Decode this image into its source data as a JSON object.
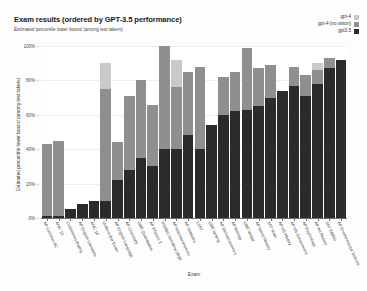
{
  "header": {
    "title": "Exam results (ordered by GPT-3.5 performance)",
    "subtitle": "Estimated percentile lower bound (among test takers)"
  },
  "legend": {
    "items": [
      {
        "label": "gpt-4",
        "color": "#c9c9c9"
      },
      {
        "label": "gpt-4 (no vision)",
        "color": "#8f8f8f"
      },
      {
        "label": "gpt3.5",
        "color": "#2b2b2b"
      }
    ]
  },
  "axes": {
    "x_title": "Exam",
    "y_title": "Estimated percentile lower bound (among test takers)",
    "y_ticks": [
      "100%",
      "80%",
      "60%",
      "40%",
      "20%",
      "0%"
    ],
    "tick_dash": "–"
  },
  "chart_data": {
    "type": "bar",
    "title": "Exam results (ordered by GPT-3.5 performance)",
    "subtitle": "Estimated percentile lower bound (among test takers)",
    "xlabel": "Exam",
    "ylabel": "Estimated percentile lower bound (among test takers)",
    "ylim": [
      0,
      100
    ],
    "ytick_values": [
      0,
      20,
      40,
      60,
      80,
      100
    ],
    "grid": true,
    "legend_position": "top-right",
    "stacked": true,
    "categories": [
      "AP Calculus BC",
      "AMC 12",
      "Codeforces Rating",
      "AP English Literature",
      "AMC 10",
      "Uniform Bar Exam",
      "AP English Language",
      "AP Chemistry",
      "GRE Quantitative",
      "AP Physics 2",
      "USABO Semifinal 2020",
      "AP Macroeconomics",
      "AP Statistics",
      "LSAT",
      "GRE Writing",
      "AP Microeconomics",
      "AP Biology",
      "GRE Verbal",
      "AP World History",
      "SAT Math",
      "AP US History",
      "AP US Government",
      "AP Psychology",
      "AP Art History",
      "SAT EBRW",
      "AP Environmental Science"
    ],
    "series": [
      {
        "name": "gpt3.5",
        "color": "#2b2b2b",
        "values": [
          1,
          1,
          5,
          8,
          10,
          10,
          22,
          28,
          35,
          30,
          40,
          40,
          48,
          40,
          54,
          60,
          62,
          63,
          65,
          70,
          74,
          77,
          71,
          78,
          87,
          92
        ]
      },
      {
        "name": "gpt-4 (no vision)",
        "color": "#8f8f8f",
        "values": [
          43,
          45,
          5,
          8,
          10,
          75,
          44,
          71,
          80,
          66,
          100,
          76,
          85,
          88,
          54,
          82,
          85,
          99,
          87,
          89,
          74,
          88,
          83,
          86,
          93,
          92
        ]
      },
      {
        "name": "gpt-4",
        "color": "#c9c9c9",
        "values": [
          43,
          45,
          5,
          8,
          10,
          90,
          44,
          71,
          80,
          66,
          100,
          92,
          85,
          88,
          54,
          82,
          85,
          99,
          87,
          89,
          74,
          88,
          83,
          90,
          93,
          92
        ]
      }
    ]
  }
}
